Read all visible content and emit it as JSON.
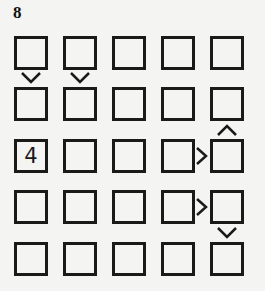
{
  "puzzle": {
    "number": "8",
    "size": 5,
    "grid": [
      [
        "",
        "",
        "",
        "",
        ""
      ],
      [
        "",
        "",
        "",
        "",
        ""
      ],
      [
        "4",
        "",
        "",
        "",
        ""
      ],
      [
        "",
        "",
        "",
        "",
        ""
      ],
      [
        "",
        "",
        "",
        "",
        ""
      ]
    ],
    "inequalities": [
      {
        "type": "vertical",
        "row": 0,
        "col": 0,
        "symbol": "v",
        "meaning": "top greater than bottom"
      },
      {
        "type": "vertical",
        "row": 0,
        "col": 1,
        "symbol": "v",
        "meaning": "top greater than bottom"
      },
      {
        "type": "vertical",
        "row": 1,
        "col": 4,
        "symbol": "^",
        "meaning": "top less than bottom"
      },
      {
        "type": "horizontal",
        "row": 2,
        "col": 3,
        "symbol": ">",
        "meaning": "left greater than right"
      },
      {
        "type": "horizontal",
        "row": 3,
        "col": 3,
        "symbol": ">",
        "meaning": "left greater than right"
      },
      {
        "type": "vertical",
        "row": 3,
        "col": 4,
        "symbol": "v",
        "meaning": "top greater than bottom"
      }
    ]
  },
  "colors": {
    "background": "#f4f4f2",
    "ink": "#1a1a1a"
  }
}
